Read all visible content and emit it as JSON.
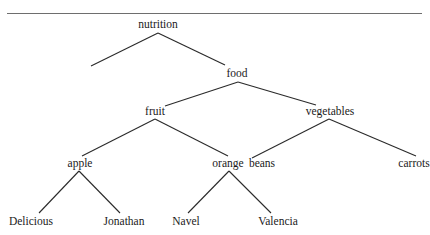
{
  "diagram": {
    "type": "tree",
    "rule_color": "#6e6e6e",
    "line_color": "#2a2a2a",
    "nodes": [
      {
        "id": "nutrition",
        "label": "nutrition",
        "x": 158,
        "y": 25
      },
      {
        "id": "food",
        "label": "food",
        "x": 237,
        "y": 74
      },
      {
        "id": "fruit",
        "label": "fruit",
        "x": 155,
        "y": 112
      },
      {
        "id": "vegetables",
        "label": "vegetables",
        "x": 330,
        "y": 112
      },
      {
        "id": "apple",
        "label": "apple",
        "x": 80,
        "y": 164
      },
      {
        "id": "orange",
        "label": "orange",
        "x": 228,
        "y": 164
      },
      {
        "id": "beans",
        "label": "beans",
        "x": 262,
        "y": 164
      },
      {
        "id": "carrots",
        "label": "carrots",
        "x": 414,
        "y": 164
      },
      {
        "id": "delicious",
        "label": "Delicious",
        "x": 31,
        "y": 222
      },
      {
        "id": "jonathan",
        "label": "Jonathan",
        "x": 124,
        "y": 222
      },
      {
        "id": "navel",
        "label": "Navel",
        "x": 186,
        "y": 222
      },
      {
        "id": "valencia",
        "label": "Valencia",
        "x": 278,
        "y": 222
      }
    ],
    "edges": [
      {
        "from": "nutrition",
        "to": "(unlabeled)",
        "x1": 158,
        "y1": 33,
        "x2": 91,
        "y2": 66
      },
      {
        "from": "nutrition",
        "to": "food",
        "x1": 158,
        "y1": 33,
        "x2": 225,
        "y2": 65
      },
      {
        "from": "food",
        "to": "fruit",
        "x1": 238,
        "y1": 82,
        "x2": 165,
        "y2": 106
      },
      {
        "from": "food",
        "to": "vegetables",
        "x1": 238,
        "y1": 82,
        "x2": 316,
        "y2": 105
      },
      {
        "from": "fruit",
        "to": "apple",
        "x1": 155,
        "y1": 119,
        "x2": 82,
        "y2": 156
      },
      {
        "from": "fruit",
        "to": "orange",
        "x1": 155,
        "y1": 119,
        "x2": 228,
        "y2": 156
      },
      {
        "from": "vegetables",
        "to": "beans",
        "x1": 329,
        "y1": 119,
        "x2": 252,
        "y2": 158
      },
      {
        "from": "vegetables",
        "to": "carrots",
        "x1": 329,
        "y1": 119,
        "x2": 416,
        "y2": 156
      },
      {
        "from": "apple",
        "to": "delicious",
        "x1": 79,
        "y1": 171,
        "x2": 39,
        "y2": 213
      },
      {
        "from": "apple",
        "to": "jonathan",
        "x1": 79,
        "y1": 171,
        "x2": 120,
        "y2": 213
      },
      {
        "from": "orange",
        "to": "navel",
        "x1": 229,
        "y1": 171,
        "x2": 188,
        "y2": 213
      },
      {
        "from": "orange",
        "to": "valencia",
        "x1": 229,
        "y1": 171,
        "x2": 271,
        "y2": 213
      }
    ]
  }
}
